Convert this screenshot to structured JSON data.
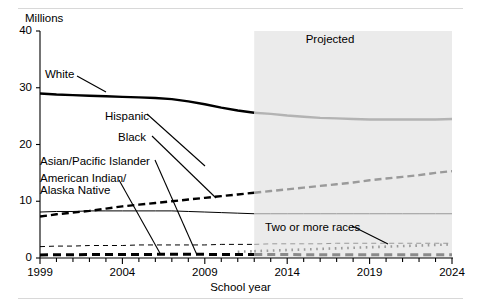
{
  "figure": {
    "unit_label": "Millions",
    "x_axis_title": "School year",
    "projected_label": "Projected"
  },
  "chart_data": {
    "type": "line",
    "title": "",
    "subtitle": "",
    "xlabel": "School year",
    "ylabel": "Millions",
    "ylim": [
      0,
      40
    ],
    "xlim": [
      1999,
      2024
    ],
    "yticks": [
      0,
      10,
      20,
      30,
      40
    ],
    "xticks": [
      1999,
      2004,
      2009,
      2014,
      2019,
      2024
    ],
    "xtick_labels": [
      "1999",
      "2004",
      "2009",
      "2014",
      "2019",
      "2024"
    ],
    "ytick_labels": [
      "0",
      "10",
      "20",
      "30",
      "40"
    ],
    "grid": false,
    "legend": "inline-labels",
    "minor_ticks_every": 1,
    "projection_start_x": 2012,
    "projection_shading_color": "#ebebeb",
    "annotations": [
      {
        "text": "Projected",
        "x": 2018,
        "y": 37.2
      },
      {
        "text": "Two or more races",
        "x": 2014.4,
        "y": 4.4
      }
    ],
    "x": [
      1999,
      2000,
      2001,
      2002,
      2003,
      2004,
      2005,
      2006,
      2007,
      2008,
      2009,
      2010,
      2011,
      2012,
      2013,
      2014,
      2015,
      2016,
      2017,
      2018,
      2019,
      2020,
      2021,
      2022,
      2023,
      2024
    ],
    "series": [
      {
        "name": "White",
        "style": "solid-thick",
        "color": "#000000",
        "projected_color": "#b3b3b3",
        "values": [
          29.0,
          28.8,
          28.7,
          28.6,
          28.5,
          28.4,
          28.3,
          28.2,
          28.0,
          27.6,
          27.1,
          26.5,
          26.0,
          25.6,
          25.4,
          25.1,
          24.9,
          24.7,
          24.6,
          24.5,
          24.4,
          24.4,
          24.4,
          24.4,
          24.4,
          24.5
        ]
      },
      {
        "name": "Hispanic",
        "style": "dashed-thick",
        "color": "#000000",
        "projected_color": "#9a9a9a",
        "values": [
          7.3,
          7.7,
          8.0,
          8.3,
          8.7,
          9.1,
          9.4,
          9.7,
          10.0,
          10.3,
          10.6,
          10.9,
          11.2,
          11.5,
          11.8,
          12.1,
          12.4,
          12.7,
          13.0,
          13.3,
          13.7,
          14.0,
          14.3,
          14.6,
          15.0,
          15.3
        ]
      },
      {
        "name": "Black",
        "style": "solid-thin",
        "color": "#000000",
        "projected_color": "#9a9a9a",
        "values": [
          8.1,
          8.2,
          8.2,
          8.3,
          8.3,
          8.3,
          8.3,
          8.3,
          8.3,
          8.2,
          8.1,
          8.0,
          7.9,
          7.8,
          7.8,
          7.8,
          7.8,
          7.8,
          7.8,
          7.8,
          7.8,
          7.8,
          7.8,
          7.8,
          7.8,
          7.8
        ]
      },
      {
        "name": "Asian/Pacific Islander",
        "style": "dashed-thin",
        "color": "#000000",
        "projected_color": "#9a9a9a",
        "values": [
          2.0,
          2.1,
          2.1,
          2.2,
          2.2,
          2.2,
          2.3,
          2.3,
          2.3,
          2.3,
          2.3,
          2.4,
          2.4,
          2.4,
          2.5,
          2.5,
          2.5,
          2.5,
          2.6,
          2.6,
          2.6,
          2.6,
          2.6,
          2.6,
          2.6,
          2.6
        ]
      },
      {
        "name": "American Indian/Alaska Native",
        "style": "dashed-heavy",
        "color": "#000000",
        "projected_color": "#8a8a8a",
        "values": [
          0.55,
          0.57,
          0.58,
          0.6,
          0.61,
          0.62,
          0.63,
          0.64,
          0.65,
          0.65,
          0.64,
          0.63,
          0.62,
          0.61,
          0.6,
          0.6,
          0.59,
          0.59,
          0.58,
          0.58,
          0.57,
          0.57,
          0.57,
          0.56,
          0.56,
          0.56
        ]
      },
      {
        "name": "Two or more races",
        "style": "dotted",
        "color": "#9a9a9a",
        "projected_color": "#9a9a9a",
        "values": [
          null,
          null,
          null,
          null,
          null,
          null,
          null,
          null,
          null,
          null,
          null,
          null,
          1.1,
          1.2,
          1.3,
          1.4,
          1.5,
          1.6,
          1.7,
          1.8,
          1.9,
          2.0,
          2.1,
          2.2,
          2.3,
          2.4
        ]
      }
    ],
    "series_labels": [
      {
        "name": "White",
        "label": "White"
      },
      {
        "name": "Hispanic",
        "label": "Hispanic"
      },
      {
        "name": "Black",
        "label": "Black"
      },
      {
        "name": "Asian/Pacific Islander",
        "label": "Asian/Pacific Islander"
      },
      {
        "name": "American Indian/Alaska Native",
        "label": "American Indian/\nAlaska Native",
        "label_line1": "American Indian/",
        "label_line2": "Alaska Native"
      },
      {
        "name": "Two or more races",
        "label": "Two or more races"
      }
    ]
  }
}
